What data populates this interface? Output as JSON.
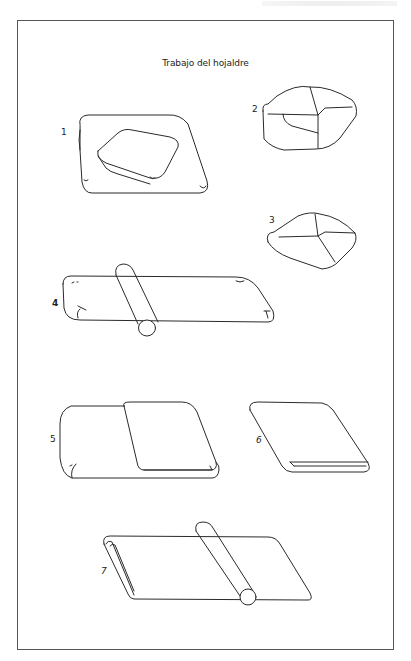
{
  "page": {
    "title": "Trabajo del hojaldre",
    "steps": [
      {
        "number": "1",
        "description": "dough-block-on-rolled-sheet"
      },
      {
        "number": "2",
        "description": "sheet-folded-over-block"
      },
      {
        "number": "3",
        "description": "enclosed-block-sealed"
      },
      {
        "number": "4",
        "description": "rolling-out-with-rolling-pin"
      },
      {
        "number": "5",
        "description": "first-fold-over"
      },
      {
        "number": "6",
        "description": "folded-in-thirds"
      },
      {
        "number": "7",
        "description": "rolling-folded-dough"
      }
    ]
  }
}
